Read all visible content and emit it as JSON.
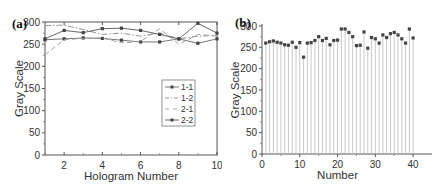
{
  "chart_data": [
    {
      "panel_label": "(a)",
      "type": "line",
      "title": "",
      "xlabel": "Hologram Number",
      "ylabel": "Gray Scale",
      "xlim": [
        1,
        10
      ],
      "ylim": [
        0,
        300
      ],
      "x_ticks": [
        2,
        4,
        6,
        8,
        10
      ],
      "y_ticks": [
        0,
        50,
        100,
        150,
        200,
        250,
        300
      ],
      "grid": false,
      "legend_position": "center-right",
      "x": [
        1,
        2,
        3,
        4,
        5,
        6,
        7,
        8,
        9,
        10
      ],
      "series": [
        {
          "name": "1-1",
          "marker": "circle",
          "dash": "solid",
          "values": [
            260,
            262,
            264,
            263,
            259,
            255,
            255,
            262,
            252,
            262
          ]
        },
        {
          "name": "1-2",
          "marker": "none",
          "dash": "dashdot",
          "values": [
            292,
            293,
            283,
            272,
            275,
            268,
            275,
            262,
            268,
            270
          ]
        },
        {
          "name": "2-1",
          "marker": "none",
          "dash": "dash",
          "values": [
            226,
            260,
            263,
            264,
            253,
            256,
            285,
            250,
            272,
            268
          ]
        },
        {
          "name": "2-2",
          "marker": "circle",
          "dash": "solid",
          "values": [
            262,
            281,
            276,
            285,
            286,
            281,
            272,
            262,
            297,
            275
          ]
        }
      ]
    },
    {
      "panel_label": "(b)",
      "type": "scatter",
      "style": "stem",
      "title": "",
      "xlabel": "Number",
      "ylabel": "Gray Scale",
      "xlim": [
        0,
        45
      ],
      "ylim": [
        0,
        300
      ],
      "x_ticks": [
        0,
        10,
        20,
        30,
        40
      ],
      "y_ticks": [
        0,
        50,
        100,
        150,
        200,
        250,
        300
      ],
      "grid": false,
      "x": [
        1,
        2,
        3,
        4,
        5,
        6,
        7,
        8,
        9,
        10,
        11,
        12,
        13,
        14,
        15,
        16,
        17,
        18,
        19,
        20,
        21,
        22,
        23,
        24,
        25,
        26,
        27,
        28,
        29,
        30,
        31,
        32,
        33,
        34,
        35,
        36,
        37,
        38,
        39,
        40
      ],
      "values": [
        260,
        263,
        265,
        262,
        260,
        256,
        255,
        262,
        250,
        261,
        227,
        260,
        261,
        266,
        275,
        266,
        271,
        256,
        266,
        267,
        293,
        293,
        285,
        275,
        254,
        255,
        286,
        248,
        273,
        270,
        260,
        279,
        273,
        282,
        285,
        279,
        270,
        260,
        293,
        272
      ]
    }
  ]
}
